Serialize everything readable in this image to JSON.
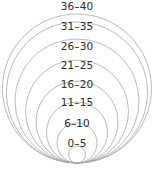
{
  "chart_data": {
    "type": "area",
    "title": "",
    "subtitle": "",
    "xlabel": "",
    "ylabel": "",
    "legend_position": "inline-labels",
    "grid": false,
    "categories": [
      "0–5",
      "6–10",
      "11–15",
      "16–20",
      "21–25",
      "26–30",
      "31–35",
      "36–40"
    ],
    "values": [
      1,
      2,
      3,
      4,
      5,
      6,
      7,
      8
    ],
    "series": [
      {
        "name": "circle radius (px)",
        "values": [
          8.5,
          20.5,
          31.0,
          41.5,
          52.0,
          62.5,
          70.5,
          74.5
        ]
      }
    ]
  },
  "diagram": {
    "background_color": "#ffffff",
    "stroke_color": "#a8a8a8",
    "label_color": "#2b2b2b",
    "tangent_point": {
      "x": 77,
      "y": 163
    },
    "circles": [
      {
        "id": "ring-36-40",
        "label": "36–40",
        "cx": 77,
        "cy": 88.5,
        "r": 74.5,
        "label_y": 1
      },
      {
        "id": "ring-31-35",
        "label": "31–35",
        "cx": 77,
        "cy": 92.5,
        "r": 70.5,
        "label_y": 21
      },
      {
        "id": "ring-26-30",
        "label": "26–30",
        "cx": 77,
        "cy": 101.0,
        "r": 62.0,
        "label_y": 41
      },
      {
        "id": "ring-21-25",
        "label": "21–25",
        "cx": 77,
        "cy": 111.5,
        "r": 51.5,
        "label_y": 60
      },
      {
        "id": "ring-16-20",
        "label": "16–20",
        "cx": 77,
        "cy": 122.0,
        "r": 41.0,
        "label_y": 79
      },
      {
        "id": "ring-11-15",
        "label": "11–15",
        "cx": 77,
        "cy": 132.5,
        "r": 30.5,
        "label_y": 97
      },
      {
        "id": "ring-6-10",
        "label": "6–10",
        "cx": 77,
        "cy": 143.0,
        "r": 20.0,
        "label_y": 118
      },
      {
        "id": "ring-0-5",
        "label": "0–5",
        "cx": 77,
        "cy": 154.5,
        "r": 8.5,
        "label_y": 138
      }
    ]
  },
  "labels": {
    "band_8": "36–40",
    "band_7": "31–35",
    "band_6": "26–30",
    "band_5": "21–25",
    "band_4": "16–20",
    "band_3": "11–15",
    "band_2": "6–10",
    "band_1": "0–5"
  }
}
